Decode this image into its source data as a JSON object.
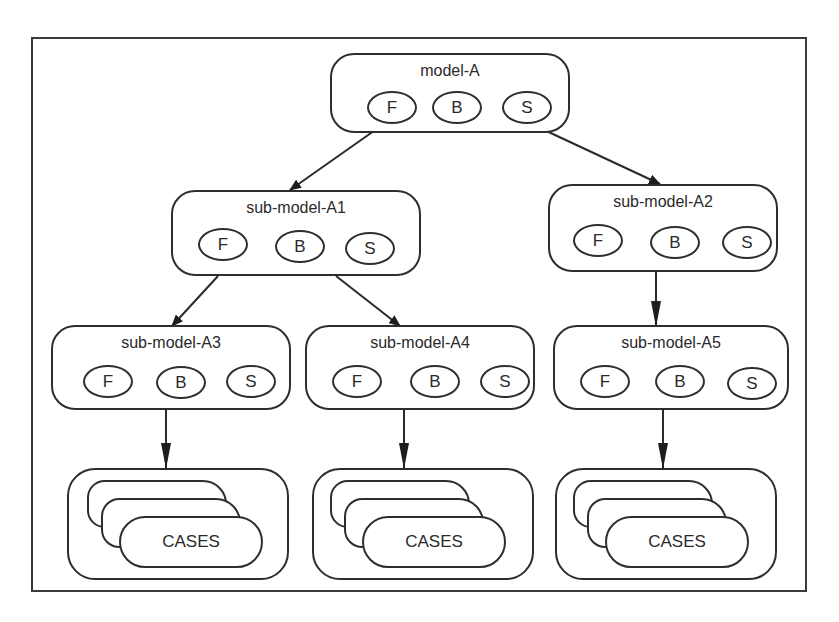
{
  "diagram": {
    "type": "hierarchy",
    "root": "model-A",
    "models": [
      {
        "id": "A",
        "label": "model-A",
        "components": [
          "F",
          "B",
          "S"
        ]
      },
      {
        "id": "A1",
        "label": "sub-model-A1",
        "components": [
          "F",
          "B",
          "S"
        ]
      },
      {
        "id": "A2",
        "label": "sub-model-A2",
        "components": [
          "F",
          "B",
          "S"
        ]
      },
      {
        "id": "A3",
        "label": "sub-model-A3",
        "components": [
          "F",
          "B",
          "S"
        ]
      },
      {
        "id": "A4",
        "label": "sub-model-A4",
        "components": [
          "F",
          "B",
          "S"
        ]
      },
      {
        "id": "A5",
        "label": "sub-model-A5",
        "components": [
          "F",
          "B",
          "S"
        ]
      }
    ],
    "case_stacks": [
      {
        "id": "cases-A3",
        "label": "CASES"
      },
      {
        "id": "cases-A4",
        "label": "CASES"
      },
      {
        "id": "cases-A5",
        "label": "CASES"
      }
    ],
    "edges": [
      {
        "from": "model-A",
        "to": "sub-model-A1"
      },
      {
        "from": "model-A",
        "to": "sub-model-A2"
      },
      {
        "from": "sub-model-A1",
        "to": "sub-model-A3"
      },
      {
        "from": "sub-model-A1",
        "to": "sub-model-A4"
      },
      {
        "from": "sub-model-A2",
        "to": "sub-model-A5"
      },
      {
        "from": "sub-model-A3",
        "to": "CASES"
      },
      {
        "from": "sub-model-A4",
        "to": "CASES"
      },
      {
        "from": "sub-model-A5",
        "to": "CASES"
      }
    ],
    "colors": {
      "stroke": "#2e2e2e",
      "background": "#ffffff",
      "text": "#2a2a2a"
    }
  }
}
